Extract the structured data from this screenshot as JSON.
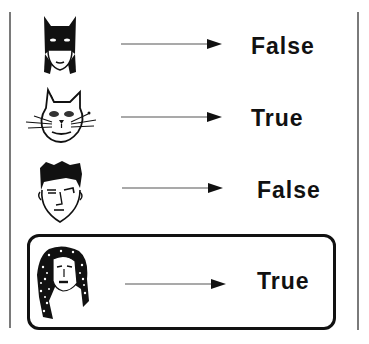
{
  "diagram": {
    "rows": [
      {
        "face": "masked-superhero-face",
        "arrow": "right-arrow",
        "label": "False",
        "highlighted": false
      },
      {
        "face": "cat-face",
        "arrow": "right-arrow",
        "label": "True",
        "highlighted": false
      },
      {
        "face": "boy-face",
        "arrow": "right-arrow",
        "label": "False",
        "highlighted": false
      },
      {
        "face": "curly-haired-woman-face",
        "arrow": "right-arrow",
        "label": "True",
        "highlighted": true
      }
    ],
    "colors": {
      "ink": "#111111",
      "border": "#7a7a7a",
      "background": "#ffffff"
    }
  }
}
